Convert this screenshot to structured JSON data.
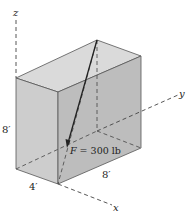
{
  "diagram": {
    "type": "3d-box-force",
    "axes": {
      "x_label": "x",
      "y_label": "y",
      "z_label": "z"
    },
    "dimensions": {
      "height": "8′",
      "width": "8′",
      "depth": "4′"
    },
    "force": {
      "label": "F = 300 lb",
      "symbol": "F",
      "magnitude": "300",
      "unit": "lb"
    },
    "colors": {
      "top_face": "#dadada",
      "front_face": "#cdcdcd",
      "right_face": "#bdbdbd",
      "edge": "#555555",
      "axis": "#444444",
      "force": "#222222"
    }
  }
}
